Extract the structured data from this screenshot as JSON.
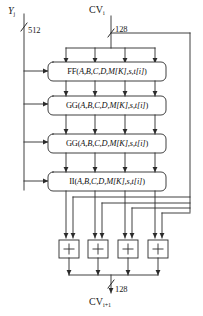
{
  "diagram": {
    "type": "block-diagram",
    "colors": {
      "line": "#2b2b2b",
      "box_stroke": "#3a3a3a",
      "box_fill": "#ffffff",
      "text": "#1a1a1a",
      "background": "#ffffff"
    },
    "inputs": [
      {
        "id": "message-block",
        "label_main": "Y",
        "label_sub": "j",
        "bus_width": "512",
        "position": "top-left"
      },
      {
        "id": "chaining-variable-in",
        "label_main": "CV",
        "label_sub": "i",
        "bus_width": "128",
        "position": "top-center"
      }
    ],
    "outputs": [
      {
        "id": "chaining-variable-out",
        "label_main": "CV",
        "label_sub": "i+1",
        "bus_width": "128",
        "position": "bottom-center"
      }
    ],
    "rounds": [
      {
        "index": 1,
        "id": "round-ff",
        "function": "FF",
        "args": "A,B,C,D,M[K],s,t[i]",
        "text": "FF(A,B,C,D,M[K],s,t[i])"
      },
      {
        "index": 2,
        "id": "round-gg-1",
        "function": "GG",
        "args": "A,B,C,D,M[K],s,t[i]",
        "text": "GG(A,B,C,D,M[K],s,t[i])"
      },
      {
        "index": 3,
        "id": "round-gg-2",
        "function": "GG",
        "args": "A,B,C,D,M[K],s,t[i]",
        "text": "GG(A,B,C,D,M[K],s,t[i])"
      },
      {
        "index": 4,
        "id": "round-ii",
        "function": "II",
        "args": "A,B,C,D,M[K],s,t[i]",
        "text": "II(A,B,C,D,M[K],s,t[i])"
      }
    ],
    "adders": [
      {
        "index": 1,
        "id": "adder-a",
        "symbol": "+"
      },
      {
        "index": 2,
        "id": "adder-b",
        "symbol": "+"
      },
      {
        "index": 3,
        "id": "adder-c",
        "symbol": "+"
      },
      {
        "index": 4,
        "id": "adder-d",
        "symbol": "+"
      }
    ],
    "word_lanes": 4,
    "notes": {
      "feedback": "CV_i bypasses the four rounds on the right-hand bus and is added word-wise to the round output",
      "lane_spacing_px": 29
    }
  }
}
